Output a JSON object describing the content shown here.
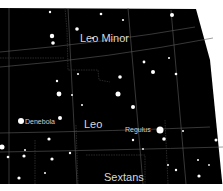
{
  "map": {
    "background": "#000000",
    "grid_color": "#5a5a5a",
    "boundary_color": "#3a3a3a",
    "star_color": "#ffffff",
    "constellations": [
      {
        "name": "Leo Minor",
        "x": 80,
        "y": 38
      },
      {
        "name": "Leo",
        "x": 84,
        "y": 124
      },
      {
        "name": "Sextans",
        "x": 104,
        "y": 177
      }
    ],
    "named_stars": [
      {
        "name": "Denebola",
        "label_x": 25,
        "label_y": 122,
        "x": 21,
        "y": 121,
        "r": 3
      },
      {
        "name": "Regulus",
        "label_x": 125,
        "label_y": 129,
        "x": 160,
        "y": 130,
        "r": 3.5
      }
    ],
    "stars": [
      {
        "x": 50,
        "y": 12,
        "r": 1.2
      },
      {
        "x": 101,
        "y": 14,
        "r": 1.3
      },
      {
        "x": 172,
        "y": 15,
        "r": 2
      },
      {
        "x": 123,
        "y": 20,
        "r": 1.1
      },
      {
        "x": 77,
        "y": 29,
        "r": 1.8
      },
      {
        "x": 52,
        "y": 36,
        "r": 2.2
      },
      {
        "x": 53,
        "y": 43,
        "r": 1.8
      },
      {
        "x": 93,
        "y": 38,
        "r": 1
      },
      {
        "x": 144,
        "y": 62,
        "r": 1.4
      },
      {
        "x": 153,
        "y": 72,
        "r": 2
      },
      {
        "x": 176,
        "y": 74,
        "r": 1.3
      },
      {
        "x": 169,
        "y": 58,
        "r": 1
      },
      {
        "x": 120,
        "y": 77,
        "r": 1.8
      },
      {
        "x": 57,
        "y": 81,
        "r": 1.2
      },
      {
        "x": 78,
        "y": 74,
        "r": 1.1
      },
      {
        "x": 59,
        "y": 94,
        "r": 2.4
      },
      {
        "x": 118,
        "y": 94,
        "r": 2.5
      },
      {
        "x": 72,
        "y": 95,
        "r": 1
      },
      {
        "x": 133,
        "y": 107,
        "r": 2
      },
      {
        "x": 82,
        "y": 105,
        "r": 1
      },
      {
        "x": 60,
        "y": 118,
        "r": 2
      },
      {
        "x": 49,
        "y": 139,
        "r": 1.6
      },
      {
        "x": 2,
        "y": 147,
        "r": 2.5
      },
      {
        "x": 8,
        "y": 157,
        "r": 1.3
      },
      {
        "x": 24,
        "y": 156,
        "r": 1.6
      },
      {
        "x": 25,
        "y": 150,
        "r": 1
      },
      {
        "x": 52,
        "y": 159,
        "r": 1.6
      },
      {
        "x": 70,
        "y": 153,
        "r": 1.2
      },
      {
        "x": 45,
        "y": 173,
        "r": 1
      },
      {
        "x": 19,
        "y": 178,
        "r": 1.6
      },
      {
        "x": 133,
        "y": 140,
        "r": 1.2
      },
      {
        "x": 164,
        "y": 139,
        "r": 1.8
      },
      {
        "x": 216,
        "y": 140,
        "r": 1.5
      },
      {
        "x": 183,
        "y": 131,
        "r": 1
      },
      {
        "x": 168,
        "y": 165,
        "r": 1
      },
      {
        "x": 176,
        "y": 170,
        "r": 1.2
      },
      {
        "x": 198,
        "y": 160,
        "r": 1
      },
      {
        "x": 199,
        "y": 176,
        "r": 1.6
      },
      {
        "x": 209,
        "y": 165,
        "r": 0.9
      },
      {
        "x": 143,
        "y": 149,
        "r": 0.9
      }
    ]
  }
}
